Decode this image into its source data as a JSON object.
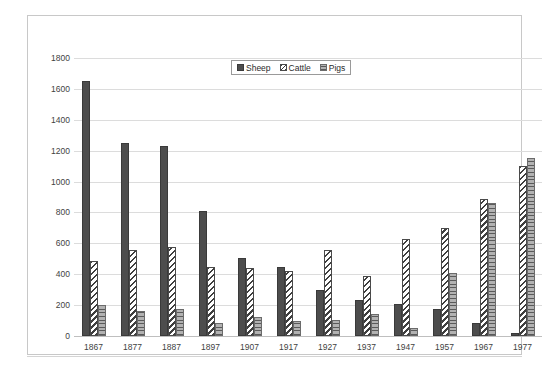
{
  "chart_data": {
    "type": "bar",
    "title": "",
    "xlabel": "",
    "ylabel": "",
    "ylim": [
      0,
      1800
    ],
    "ytick_step": 200,
    "yticks": [
      0,
      200,
      400,
      600,
      800,
      1000,
      1200,
      1400,
      1600,
      1800
    ],
    "grid": true,
    "legend_position": "top-center",
    "categories": [
      "1867",
      "1877",
      "1887",
      "1897",
      "1907",
      "1917",
      "1927",
      "1937",
      "1947",
      "1957",
      "1967",
      "1977"
    ],
    "series": [
      {
        "name": "Sheep",
        "color": "#4d4d4d",
        "pattern": "solid",
        "values": [
          1650,
          1250,
          1230,
          810,
          505,
          445,
          295,
          230,
          205,
          175,
          85,
          20
        ]
      },
      {
        "name": "Cattle",
        "color": "#3f3f3f",
        "pattern": "diagonal-stripes",
        "values": [
          485,
          560,
          575,
          450,
          440,
          420,
          560,
          390,
          625,
          700,
          890,
          1100
        ]
      },
      {
        "name": "Pigs",
        "color": "#b2b2b2",
        "pattern": "horizontal-lines",
        "values": [
          200,
          160,
          175,
          85,
          125,
          100,
          105,
          140,
          50,
          410,
          860,
          1150
        ]
      }
    ]
  },
  "legend": {
    "items": [
      {
        "label": "Sheep",
        "swatch": "sheep-swatch-icon"
      },
      {
        "label": "Cattle",
        "swatch": "cattle-swatch-icon"
      },
      {
        "label": "Pigs",
        "swatch": "pigs-swatch-icon"
      }
    ]
  }
}
